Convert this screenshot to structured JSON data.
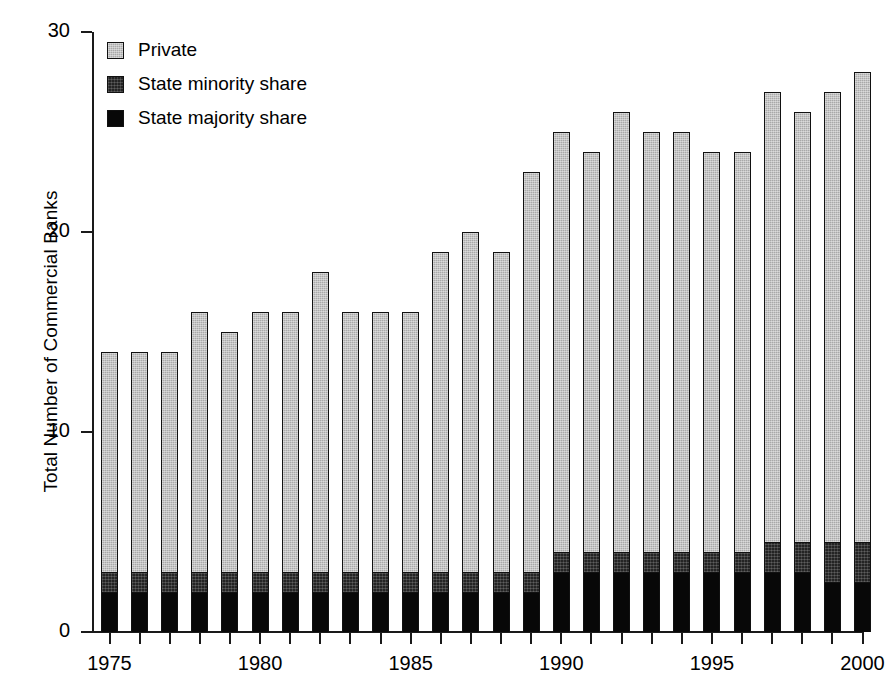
{
  "chart_data": {
    "type": "bar",
    "subtype": "stacked-vertical",
    "title": "",
    "xlabel": "",
    "ylabel": "Total Number of Commercial Banks",
    "ylim": [
      0,
      30
    ],
    "yticks": [
      0,
      10,
      20,
      30
    ],
    "ytick_labels": [
      "0",
      "10",
      "20",
      "30"
    ],
    "grid": false,
    "legend_position": "top-left",
    "xlim": [
      1975,
      2000
    ],
    "xticks": [
      1975,
      1980,
      1985,
      1990,
      1995,
      2000
    ],
    "xtick_labels": [
      "1975",
      "1980",
      "1985",
      "1990",
      "1995",
      "2000"
    ],
    "x_minor_ticks_every": 1,
    "categories": [
      "1975",
      "1976",
      "1977",
      "1978",
      "1979",
      "1980",
      "1981",
      "1982",
      "1983",
      "1984",
      "1985",
      "1986",
      "1987",
      "1988",
      "1989",
      "1990",
      "1991",
      "1992",
      "1993",
      "1994",
      "1995",
      "1996",
      "1997",
      "1998",
      "1999",
      "2000"
    ],
    "stack_order_bottom_to_top": [
      "State majority share",
      "State minority share",
      "Private"
    ],
    "series": [
      {
        "name": "State majority share",
        "color": "#080808",
        "values": [
          2,
          2,
          2,
          2,
          2,
          2,
          2,
          2,
          2,
          2,
          2,
          2,
          2,
          2,
          2,
          3,
          3,
          3,
          3,
          3,
          3,
          3,
          3,
          3,
          2.5,
          2.5
        ]
      },
      {
        "name": "State minority share",
        "color": "#242424",
        "values": [
          1,
          1,
          1,
          1,
          1,
          1,
          1,
          1,
          1,
          1,
          1,
          1,
          1,
          1,
          1,
          1,
          1,
          1,
          1,
          1,
          1,
          1,
          1.5,
          1.5,
          2,
          2
        ]
      },
      {
        "name": "Private",
        "color": "#a9a9a9",
        "values": [
          11,
          11,
          11,
          13,
          12,
          13,
          13,
          15,
          13,
          13,
          13,
          16,
          17,
          16,
          20,
          21,
          20,
          22,
          21,
          21,
          20,
          20,
          22.5,
          21.5,
          22.5,
          23.5
        ]
      }
    ],
    "totals": [
      14,
      14,
      14,
      16,
      15,
      16,
      16,
      18,
      16,
      16,
      16,
      19,
      20,
      19,
      23,
      25,
      24,
      26,
      25,
      25,
      24,
      24,
      27,
      26,
      27,
      28
    ]
  },
  "legend": {
    "items": [
      {
        "label": "Private",
        "swatch": "legend-swatch-private"
      },
      {
        "label": "State minority share",
        "swatch": "legend-swatch-state-minority"
      },
      {
        "label": "State majority share",
        "swatch": "legend-swatch-state-majority"
      }
    ]
  },
  "colors": {
    "private": "#a9a9a9",
    "state_minority": "#242424",
    "state_majority": "#080808",
    "axis": "#1a1a1a",
    "text": "#000000",
    "background": "#ffffff"
  }
}
